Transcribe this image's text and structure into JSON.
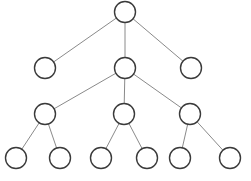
{
  "diagram": {
    "type": "tree",
    "node_radius": 10.5,
    "colors": {
      "background": "#ffffff",
      "node_stroke": "#3a3a3a",
      "node_fill": "#ffffff",
      "edge_stroke": "#8a8a8a"
    },
    "nodes": [
      {
        "id": "root",
        "x": 125,
        "y": 12
      },
      {
        "id": "a",
        "x": 45,
        "y": 68
      },
      {
        "id": "b",
        "x": 125,
        "y": 68
      },
      {
        "id": "c",
        "x": 191,
        "y": 68
      },
      {
        "id": "b1",
        "x": 45,
        "y": 114
      },
      {
        "id": "b2",
        "x": 124,
        "y": 114
      },
      {
        "id": "b3",
        "x": 190,
        "y": 114
      },
      {
        "id": "b1a",
        "x": 16,
        "y": 158
      },
      {
        "id": "b1b",
        "x": 60,
        "y": 158
      },
      {
        "id": "b2a",
        "x": 101,
        "y": 158
      },
      {
        "id": "b2b",
        "x": 147,
        "y": 158
      },
      {
        "id": "b3a",
        "x": 180,
        "y": 158
      },
      {
        "id": "b3b",
        "x": 230,
        "y": 158
      }
    ],
    "edges": [
      [
        "root",
        "a"
      ],
      [
        "root",
        "b"
      ],
      [
        "root",
        "c"
      ],
      [
        "b",
        "b1"
      ],
      [
        "b",
        "b2"
      ],
      [
        "b",
        "b3"
      ],
      [
        "b1",
        "b1a"
      ],
      [
        "b1",
        "b1b"
      ],
      [
        "b2",
        "b2a"
      ],
      [
        "b2",
        "b2b"
      ],
      [
        "b3",
        "b3a"
      ],
      [
        "b3",
        "b3b"
      ]
    ]
  }
}
